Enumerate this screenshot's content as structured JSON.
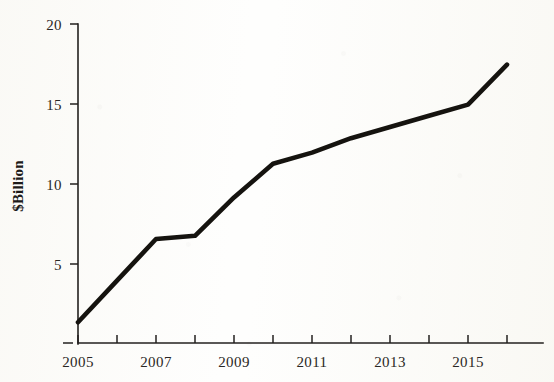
{
  "chart_data": {
    "type": "line",
    "title": "",
    "subtitle": "",
    "xlabel": "",
    "ylabel": "$Billion",
    "x": [
      2005,
      2006,
      2007,
      2008,
      2009,
      2010,
      2011,
      2012,
      2013,
      2014,
      2015,
      2016
    ],
    "values": [
      1.3,
      3.9,
      6.5,
      6.7,
      9.1,
      11.2,
      11.9,
      12.8,
      13.5,
      14.2,
      14.9,
      17.4
    ],
    "series": [
      {
        "name": "$Billion",
        "values": [
          1.3,
          3.9,
          6.5,
          6.7,
          9.1,
          11.2,
          11.9,
          12.8,
          13.5,
          14.2,
          14.9,
          17.4
        ]
      }
    ],
    "xlim": [
      2005,
      2016.9
    ],
    "ylim": [
      0,
      20
    ],
    "grid": false,
    "legend": false,
    "legend_position": "none",
    "line_color": "#15130f",
    "background_color": "#fdfdfb",
    "y_ticks": [
      0,
      5,
      10,
      15,
      20
    ],
    "y_tick_labels": [
      "",
      "5",
      "10",
      "15",
      "20"
    ],
    "x_ticks": [
      2005,
      2006,
      2007,
      2008,
      2009,
      2010,
      2011,
      2012,
      2013,
      2014,
      2015,
      2016
    ],
    "x_tick_labels": [
      "2005",
      "",
      "2007",
      "",
      "2009",
      "",
      "2011",
      "",
      "2013",
      "",
      "2015",
      ""
    ]
  },
  "axes": {
    "y_axis_name": "y-axis",
    "x_axis_name": "x-axis",
    "y_label": "$Billion"
  },
  "y_tick_text": {
    "t20": "20",
    "t15": "15",
    "t10": "10",
    "t5": "5"
  },
  "x_tick_text": {
    "t2005": "2005",
    "t2007": "2007",
    "t2009": "2009",
    "t2011": "2011",
    "t2013": "2013",
    "t2015": "2015"
  }
}
